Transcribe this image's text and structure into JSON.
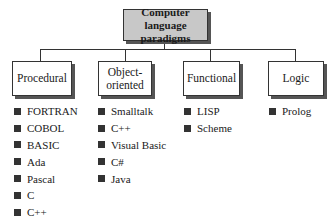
{
  "root": {
    "label": "Computer language paradigms"
  },
  "categories": [
    {
      "label": "Procedural",
      "items": [
        "FORTRAN",
        "COBOL",
        "BASIC",
        "Ada",
        "Pascal",
        "C",
        "C++"
      ]
    },
    {
      "label": "Object-oriented",
      "items": [
        "Smalltalk",
        "C++",
        "Visual Basic",
        "C#",
        "Java"
      ]
    },
    {
      "label": "Functional",
      "items": [
        "LISP",
        "Scheme"
      ]
    },
    {
      "label": "Logic",
      "items": [
        "Prolog"
      ]
    }
  ],
  "colors": {
    "root_fill": "#c8c8c8",
    "box_border": "#333333",
    "bullet": "#333333"
  }
}
